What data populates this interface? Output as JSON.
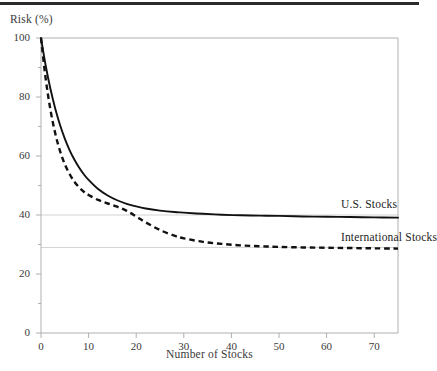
{
  "figure": {
    "top_rule": "decorative-rule",
    "background_color": "#ffffff",
    "axis_color": "#b0b0b0",
    "text_color": "#3a3a3a",
    "series_color": "#111111",
    "reference_line_color": "#d3d3d3"
  },
  "chart_data": {
    "type": "line",
    "title": "",
    "subtitle": "",
    "xlabel": "Number of Stocks",
    "ylabel": "Risk (%)",
    "xlim": [
      0,
      75
    ],
    "ylim": [
      0,
      100
    ],
    "grid": false,
    "legend_position": "inline-right-annotation",
    "x_ticks": [
      0,
      10,
      20,
      30,
      40,
      50,
      60,
      70
    ],
    "x_tick_labels": [
      "0",
      "10",
      "20",
      "30",
      "40",
      "50",
      "60",
      "70"
    ],
    "x_minor_ticks": [
      5,
      15,
      25,
      35,
      45,
      55,
      65,
      75
    ],
    "y_ticks": [
      0,
      20,
      40,
      60,
      80,
      100
    ],
    "y_tick_labels": [
      "0",
      "20",
      "40",
      "60",
      "80",
      "100"
    ],
    "y_minor_ticks": [
      10,
      30,
      50,
      70,
      90
    ],
    "reference_lines": [
      {
        "name": "us-asymptote",
        "y": 40
      },
      {
        "name": "international-asymptote",
        "y": 29
      }
    ],
    "x": [
      0,
      1,
      2,
      3,
      4,
      5,
      6,
      7,
      8,
      9,
      10,
      12,
      14,
      16,
      18,
      20,
      22,
      25,
      28,
      30,
      34,
      38,
      42,
      46,
      50,
      55,
      60,
      65,
      70,
      75
    ],
    "series": [
      {
        "name": "U.S. Stocks",
        "style": "solid",
        "color": "#111111",
        "asymptote": 39,
        "values": [
          100,
          90.5,
          82.6,
          76.0,
          70.5,
          65.9,
          62.0,
          58.8,
          56.1,
          53.8,
          51.9,
          48.8,
          46.6,
          45.0,
          43.8,
          42.9,
          42.2,
          41.5,
          41.0,
          40.8,
          40.4,
          40.1,
          39.9,
          39.8,
          39.7,
          39.5,
          39.4,
          39.3,
          39.2,
          39.1
        ]
      },
      {
        "name": "International Stocks",
        "style": "dashed",
        "color": "#111111",
        "asymptote": 28.5,
        "values": [
          100,
          86.0,
          75.5,
          67.6,
          61.7,
          57.2,
          53.9,
          51.3,
          49.4,
          47.9,
          46.8,
          45.1,
          43.9,
          42.8,
          41.4,
          39.5,
          37.5,
          34.9,
          33.0,
          32.1,
          30.9,
          30.2,
          29.7,
          29.4,
          29.2,
          29.0,
          28.9,
          28.8,
          28.7,
          28.6
        ]
      }
    ],
    "annotations": [
      {
        "name": "us-stocks-label",
        "text": "U.S. Stocks",
        "x": 63,
        "y": 43
      },
      {
        "name": "international-stocks-label",
        "text": "International Stocks",
        "x": 63,
        "y": 32
      }
    ]
  }
}
